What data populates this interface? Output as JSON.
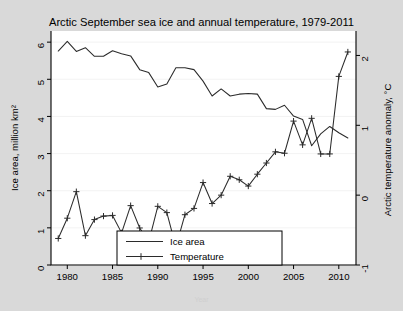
{
  "figure": {
    "background_color": "#d9d9d9",
    "plot_background_color": "#ffffff",
    "line_color": "#2b2b2b",
    "footer_note": "Year"
  },
  "legend": {
    "position": "bottom-center",
    "entries": [
      {
        "label": "Ice area",
        "marker": "none"
      },
      {
        "label": "Temperature",
        "marker": "plus"
      }
    ]
  },
  "chart_data": {
    "type": "line",
    "title": "Arctic September sea ice and annual temperature, 1979-2011",
    "xlabel": "",
    "ylabel": "Ice area, million km²",
    "y2label": "Arctic temperature anomaly, °C",
    "xlim": [
      1978.2,
      2011.9
    ],
    "ylim": [
      0,
      6.3
    ],
    "y2lim": [
      -1,
      2.35
    ],
    "grid": true,
    "xticks": [
      1980,
      1985,
      1990,
      1995,
      2000,
      2005,
      2010
    ],
    "yticks": [
      0,
      1,
      2,
      3,
      4,
      5,
      6
    ],
    "y2ticks": [
      -1,
      0,
      1,
      2
    ],
    "x": [
      1979,
      1980,
      1981,
      1982,
      1983,
      1984,
      1985,
      1986,
      1987,
      1988,
      1989,
      1990,
      1991,
      1992,
      1993,
      1994,
      1995,
      1996,
      1997,
      1998,
      1999,
      2000,
      2001,
      2002,
      2003,
      2004,
      2005,
      2006,
      2007,
      2008,
      2009,
      2010,
      2011
    ],
    "series": [
      {
        "name": "Ice area",
        "axis": "left",
        "units": "million km²",
        "marker": "none",
        "values": [
          5.76,
          6.02,
          5.75,
          5.85,
          5.62,
          5.62,
          5.77,
          5.69,
          5.63,
          5.26,
          5.18,
          4.79,
          4.87,
          5.31,
          5.31,
          5.26,
          4.95,
          4.55,
          4.74,
          4.55,
          4.6,
          4.62,
          4.6,
          4.21,
          4.19,
          4.3,
          4.01,
          3.92,
          3.21,
          3.53,
          3.73,
          3.56,
          3.42
        ]
      },
      {
        "name": "Temperature",
        "axis": "right",
        "units": "°C",
        "marker": "plus",
        "values": [
          -0.62,
          -0.33,
          0.05,
          -0.58,
          -0.35,
          -0.3,
          -0.29,
          -0.54,
          -0.15,
          -0.47,
          -0.67,
          -0.16,
          -0.25,
          -0.74,
          -0.28,
          -0.19,
          0.18,
          -0.12,
          0.0,
          0.27,
          0.22,
          0.13,
          0.3,
          0.46,
          0.62,
          0.6,
          1.06,
          0.72,
          1.1,
          0.59,
          0.59,
          1.7,
          2.05
        ]
      }
    ]
  }
}
